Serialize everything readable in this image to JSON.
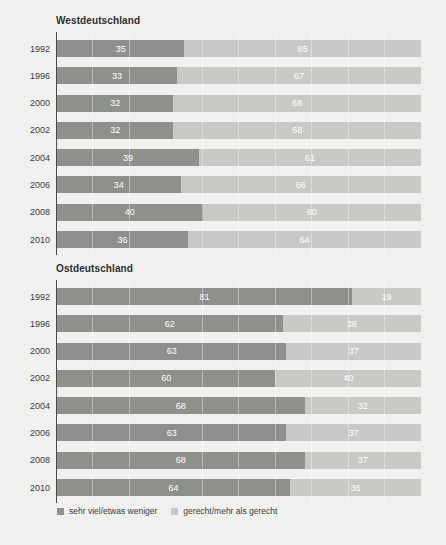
{
  "colors": {
    "background": "#f0f1ee",
    "dark_bar": "#8e908c",
    "light_bar": "#c6c9c4",
    "bar_label": "#ffffff",
    "axis": "#4a4a4a"
  },
  "legend": {
    "items": [
      {
        "label": "sehr viel/etwas weniger",
        "color": "#8e908c"
      },
      {
        "label": "gerecht/mehr als gerecht",
        "color": "#c6c9c4"
      }
    ]
  },
  "chart_data": [
    {
      "type": "bar",
      "orientation": "horizontal-stacked",
      "title": "Westdeutschland",
      "unit": "percent",
      "xlim": [
        0,
        100
      ],
      "grid": "faint-vertical",
      "categories": [
        "1992",
        "1996",
        "2000",
        "2002",
        "2004",
        "2006",
        "2008",
        "2010"
      ],
      "series": [
        {
          "name": "sehr viel/etwas weniger",
          "values": [
            35,
            33,
            32,
            32,
            39,
            34,
            40,
            36
          ]
        },
        {
          "name": "gerecht/mehr als gerecht",
          "values": [
            65,
            67,
            68,
            68,
            61,
            66,
            60,
            64
          ]
        }
      ]
    },
    {
      "type": "bar",
      "orientation": "horizontal-stacked",
      "title": "Ostdeutschland",
      "unit": "percent",
      "xlim": [
        0,
        100
      ],
      "grid": "faint-vertical",
      "categories": [
        "1992",
        "1996",
        "2000",
        "2002",
        "2004",
        "2006",
        "2008",
        "2010"
      ],
      "series": [
        {
          "name": "sehr viel/etwas weniger",
          "values": [
            81,
            62,
            63,
            60,
            68,
            63,
            68,
            64
          ]
        },
        {
          "name": "gerecht/mehr als gerecht",
          "values": [
            19,
            38,
            37,
            40,
            32,
            37,
            37,
            36
          ]
        }
      ]
    }
  ]
}
